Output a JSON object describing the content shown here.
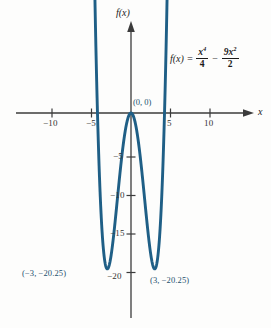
{
  "figure": {
    "curve_color": "#1f5f86",
    "axis_color": "#3b3b3b"
  },
  "equation": {
    "lhs": "f(x) =",
    "term1_num": "x",
    "term1_num_exp": "4",
    "term1_den": "4",
    "operator": "−",
    "term2_num": "9x",
    "term2_num_exp": "2",
    "term2_den": "2"
  },
  "axes": {
    "x_label": "x",
    "y_label": "f(x)",
    "x_ticks": [
      {
        "value": -10,
        "label": "−10"
      },
      {
        "value": -5,
        "label": "−5"
      },
      {
        "value": 5,
        "label": "5"
      },
      {
        "value": 10,
        "label": "10"
      }
    ],
    "y_ticks": [
      {
        "value": -5,
        "label": "−5"
      },
      {
        "value": -10,
        "label": "−10"
      },
      {
        "value": -15,
        "label": "−15"
      },
      {
        "value": -20,
        "label": "−20"
      }
    ]
  },
  "annotations": [
    {
      "name": "origin-point-label",
      "text": "(0, 0)",
      "x": 0,
      "y": 0
    },
    {
      "name": "left-minimum-label",
      "text": "(−3, −20.25)",
      "x": -3,
      "y": -20.25
    },
    {
      "name": "right-minimum-label",
      "text": "(3, −20.25)",
      "x": 3,
      "y": -20.25
    }
  ],
  "chart_data": {
    "type": "line",
    "xlabel": "x",
    "ylabel": "f(x)",
    "xlim": [
      -13.5,
      12.5
    ],
    "ylim": [
      -23.5,
      5
    ],
    "grid": false,
    "legend": "none",
    "function": "x**4/4 - 9*x**2/2",
    "domain_drawn": [
      -5.05,
      5.05
    ],
    "critical_points": [
      {
        "x": -3,
        "y": -20.25,
        "kind": "minimum"
      },
      {
        "x": 0,
        "y": 0,
        "kind": "maximum"
      },
      {
        "x": 3,
        "y": -20.25,
        "kind": "minimum"
      }
    ],
    "x_ticks": [
      -10,
      -5,
      5,
      10
    ],
    "y_ticks": [
      -5,
      -10,
      -15,
      -20
    ],
    "series": [
      {
        "name": "f(x)",
        "x": [
          -5.05,
          -4.9,
          -4.7,
          -4.5,
          -4.25,
          -4.0,
          -3.75,
          -3.5,
          -3.25,
          -3.0,
          -2.75,
          -2.5,
          -2.25,
          -2.0,
          -1.75,
          -1.5,
          -1.25,
          -1.0,
          -0.75,
          -0.5,
          -0.25,
          0,
          0.25,
          0.5,
          0.75,
          1.0,
          1.25,
          1.5,
          1.75,
          2.0,
          2.25,
          2.5,
          2.75,
          3.0,
          3.25,
          3.5,
          3.75,
          4.0,
          4.25,
          4.5,
          4.7,
          4.9,
          5.05
        ],
        "y": [
          47.27,
          36.08,
          22.67,
          11.39,
          0.72,
          -8.0,
          -14.69,
          -19.49,
          -22.55,
          -24.0,
          -24.0,
          -18.36,
          -17.17,
          -14.0,
          -9.9,
          -5.2,
          -0.42,
          4.0,
          7.84,
          10.88,
          12.92,
          13.78,
          12.92,
          10.88,
          7.84,
          4.0,
          -0.42,
          -5.2,
          -9.9,
          -14.0,
          -17.17,
          -18.36,
          -24.0,
          -24.0,
          -22.55,
          -19.49,
          -14.69,
          -8.0,
          0.72,
          11.39,
          22.67,
          36.08,
          47.27
        ]
      }
    ]
  }
}
